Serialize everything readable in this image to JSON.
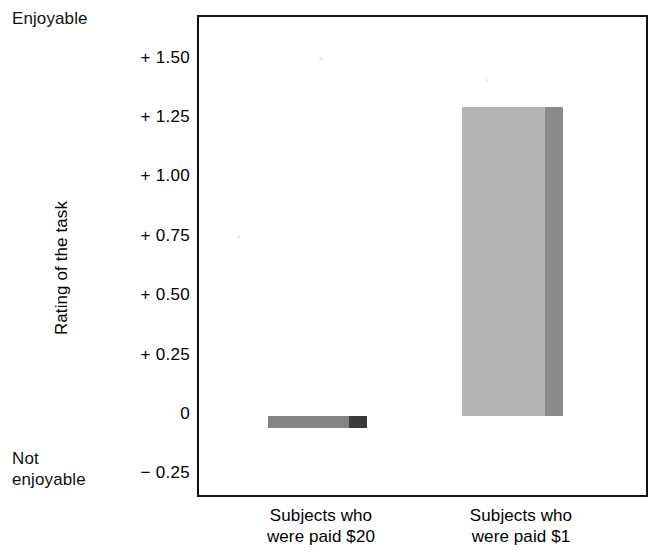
{
  "chart_data": {
    "type": "bar",
    "title": "",
    "xlabel": "",
    "ylabel": "Rating of the task",
    "categories": [
      "Subjects who\nwere paid $20",
      "Subjects who\nwere paid $1"
    ],
    "values": [
      -0.05,
      1.3
    ],
    "ylim": [
      -0.35,
      1.68
    ],
    "yticks": [
      1.5,
      1.25,
      1.0,
      0.75,
      0.5,
      0.25,
      0,
      -0.25
    ],
    "ytick_labels": [
      "+ 1.50",
      "+ 1.25",
      "+ 1.00",
      "+ 0.75",
      "+ 0.50",
      "+ 0.25",
      "0",
      "− 0.25"
    ],
    "grid": false,
    "legend": null,
    "axis_anchors": {
      "high": "Enjoyable",
      "low": "Not\nenjoyable"
    },
    "bar_colors": [
      "#838383",
      "#b4b4b4"
    ],
    "bar_side_colors": [
      "#3a3a3a",
      "#8a8a8a"
    ],
    "frame_color": "#111111"
  },
  "labels": {
    "anchor_high": "Enjoyable",
    "anchor_low": "Not\nenjoyable",
    "y_axis_title": "Rating of the task"
  }
}
